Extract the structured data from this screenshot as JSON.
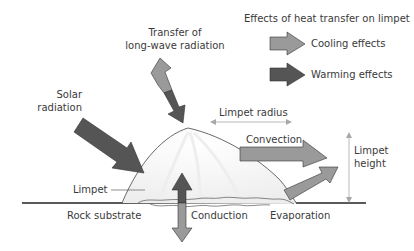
{
  "legend": {
    "title": "Effects of heat transfer on limpet",
    "items": [
      {
        "label": "Cooling effects",
        "color": "#9a9a9a",
        "icon": "arrow-right-icon"
      },
      {
        "label": "Warming effects",
        "color": "#555555",
        "icon": "arrow-right-icon"
      }
    ]
  },
  "labels": {
    "longwave_line1": "Transfer of",
    "longwave_line2": "long-wave radiation",
    "solar_line1": "Solar",
    "solar_line2": "radiation",
    "limpet_radius": "Limpet radius",
    "convection": "Convection",
    "limpet_height_line1": "Limpet",
    "limpet_height_line2": "height",
    "limpet": "Limpet",
    "rock_substrate": "Rock substrate",
    "conduction": "Conduction",
    "evaporation": "Evaporation"
  },
  "colors": {
    "cooling": "#9a9a9a",
    "warming": "#555555",
    "outline": "#333333",
    "dimension": "#a8a8a8"
  }
}
